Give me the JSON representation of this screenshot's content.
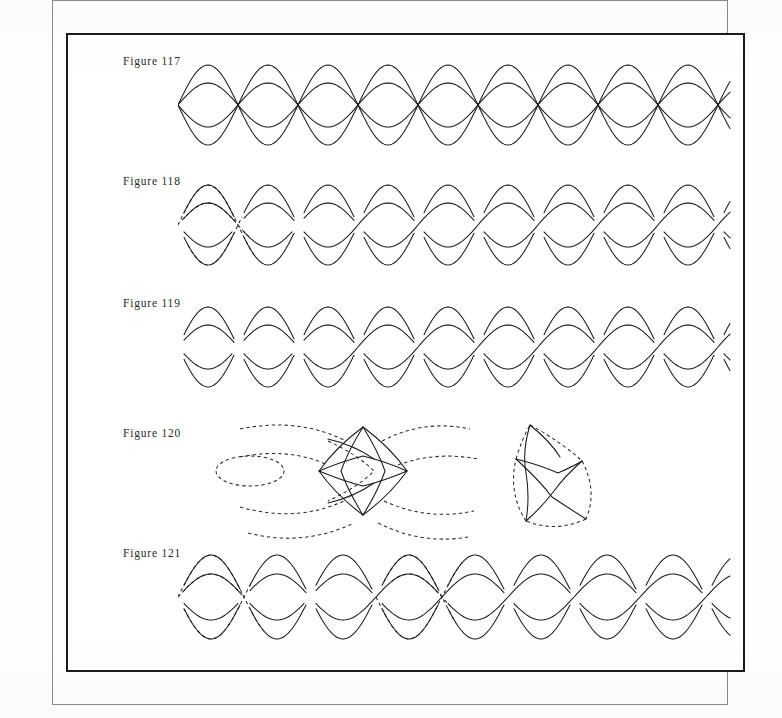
{
  "page": {
    "kind": "book-plate-scan",
    "background_color": "#fefefe",
    "ink_color": "#1a1a1a",
    "outer_frame_color": "#8a8a8a",
    "plate_border_color": "#1b1b1b"
  },
  "figures": [
    {
      "id": "figure-117",
      "label": "Figure 117",
      "label_x": 55,
      "label_y": 20,
      "art_x": 110,
      "art_y": 16,
      "art_w": 560,
      "art_h": 108,
      "caption_only": false,
      "pattern": {
        "type": "sine-lattice",
        "description": "Four superimposed phase-shifted sine waves forming an open plaited lattice; all crossings drawn through, no over/under breaks.",
        "wavelength": 120,
        "periods": 4.6,
        "bands": [
          {
            "amplitude": 40,
            "midline": 54,
            "phase": 0
          },
          {
            "amplitude": 40,
            "midline": 54,
            "phase": 180
          },
          {
            "amplitude": 22,
            "midline": 54,
            "phase": 0
          },
          {
            "amplitude": 22,
            "midline": 54,
            "phase": 180
          }
        ],
        "dashed_guides": 0
      }
    },
    {
      "id": "figure-118",
      "label": "Figure 118",
      "label_x": 55,
      "label_y": 140,
      "art_x": 110,
      "art_y": 136,
      "art_w": 560,
      "art_h": 108,
      "caption_only": false,
      "pattern": {
        "type": "interlace-braid",
        "description": "Same lattice resolved into a woven two-strand braid; ribbon edges broken at the under-crossings. Dashed construction arcs remain visible at the left-hand start.",
        "wavelength": 120,
        "periods": 4.6,
        "bands": [
          {
            "amplitude": 40,
            "midline": 54,
            "phase": 0
          },
          {
            "amplitude": 40,
            "midline": 54,
            "phase": 180
          },
          {
            "amplitude": 22,
            "midline": 54,
            "phase": 0
          },
          {
            "amplitude": 22,
            "midline": 54,
            "phase": 180
          }
        ],
        "dashed_guides": 3
      }
    },
    {
      "id": "figure-119",
      "label": "Figure 119",
      "label_x": 55,
      "label_y": 262,
      "art_x": 110,
      "art_y": 256,
      "art_w": 560,
      "art_h": 112,
      "caption_only": false,
      "pattern": {
        "type": "interlace-braid",
        "description": "Completed plait with all construction lines erased; continuous ribbon bands alternate over and under at every crossing.",
        "wavelength": 120,
        "periods": 4.6,
        "bands": [
          {
            "amplitude": 40,
            "midline": 56,
            "phase": 0
          },
          {
            "amplitude": 40,
            "midline": 56,
            "phase": 180
          },
          {
            "amplitude": 22,
            "midline": 56,
            "phase": 0
          },
          {
            "amplitude": 22,
            "midline": 56,
            "phase": 180
          }
        ],
        "dashed_guides": 0
      }
    },
    {
      "id": "figure-120",
      "label": "Figure 120",
      "label_x": 55,
      "label_y": 392,
      "art_x": 110,
      "art_y": 376,
      "art_w": 560,
      "art_h": 130,
      "caption_only": false,
      "pattern": {
        "type": "detail-lozenge",
        "description": "Enlarged detail of a single crossing cell. Left: the lozenge drawn in solid line with the surrounding generating arcs shown dashed. Right: the same lozenge isolated, its outline dashed and the four interior ribbon arcs solid.",
        "cells": 2,
        "dashed_guides": 10
      }
    },
    {
      "id": "figure-121",
      "label": "Figure 121",
      "label_x": 55,
      "label_y": 512,
      "art_x": 110,
      "art_y": 502,
      "art_w": 560,
      "art_h": 126,
      "caption_only": false,
      "pattern": {
        "type": "interlace-braid-variant",
        "description": "Variant plait in which two of the crossings are re-routed; dashed lines mark the discarded original paths at the left and centre.",
        "wavelength": 132,
        "periods": 4.2,
        "bands": [
          {
            "amplitude": 42,
            "midline": 60,
            "phase": 0
          },
          {
            "amplitude": 42,
            "midline": 60,
            "phase": 180
          },
          {
            "amplitude": 23,
            "midline": 60,
            "phase": 0
          },
          {
            "amplitude": 23,
            "midline": 60,
            "phase": 180
          }
        ],
        "dashed_guides": 6
      }
    }
  ]
}
